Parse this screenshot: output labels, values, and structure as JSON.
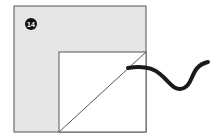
{
  "diagram": {
    "step_number": "14",
    "colors": {
      "outer_fill": "#e6e6e6",
      "inner_fill": "#ffffff",
      "stroke": "#555555",
      "badge": "#111111",
      "badge_text": "#ffffff",
      "cord": "#1a1a1a"
    }
  }
}
